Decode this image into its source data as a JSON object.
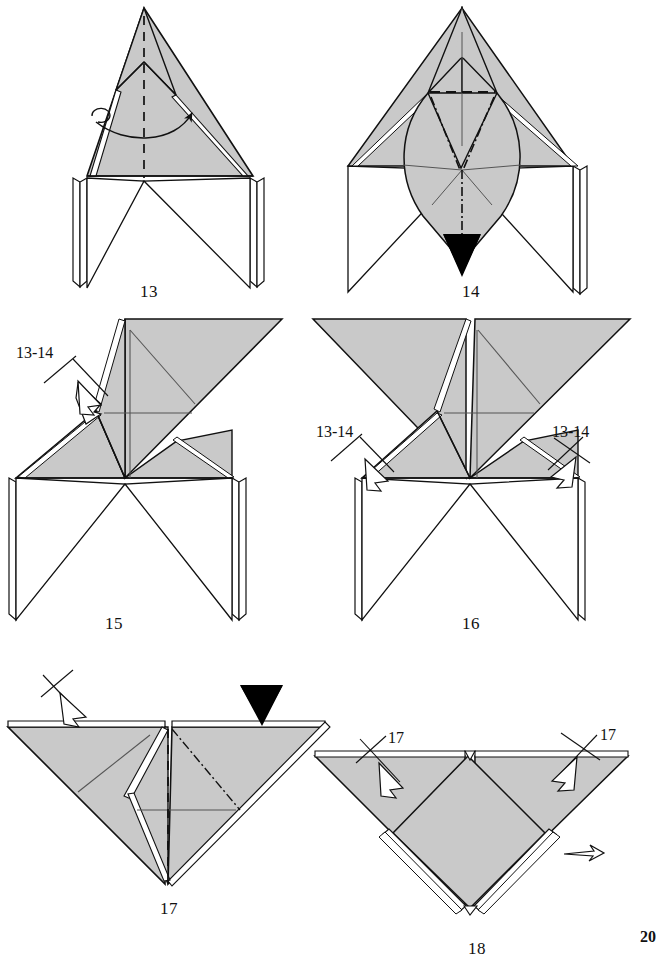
{
  "page": {
    "kind": "origami-instruction-diagram",
    "width": 653,
    "height": 968,
    "background_color": "#ffffff",
    "page_number": "20",
    "page_number_clipped": true
  },
  "style": {
    "paper_fill": "#c9c9c9",
    "paper_fill_light": "#d2d2d2",
    "paper_back": "#ffffff",
    "edge_stroke": "#111111",
    "crease_stroke": "#555555",
    "solid_arrow_fill": "#000000",
    "hollow_arrow_fill": "#ffffff"
  },
  "figures": [
    {
      "id": "fig-13",
      "step_number": "13",
      "label_x": 140,
      "label_y": 283,
      "symbols": [
        {
          "name": "fold-over-arrow",
          "kind": "curved-arrow",
          "meaning": "fold flap across to the right"
        },
        {
          "name": "valley-fold-line",
          "kind": "dashed-line",
          "meaning": "valley fold on vertical centre line"
        }
      ]
    },
    {
      "id": "fig-14",
      "step_number": "14",
      "label_x": 462,
      "label_y": 283,
      "symbols": [
        {
          "name": "push-in-arrow",
          "kind": "solid-black-arrow",
          "meaning": "push / sink here"
        },
        {
          "name": "valley-fold-line",
          "kind": "dashed-line",
          "meaning": "horizontal valley fold"
        },
        {
          "name": "mountain-fold-line",
          "kind": "dash-dot-line",
          "meaning": "mountain fold"
        }
      ]
    },
    {
      "id": "fig-15",
      "step_number": "15",
      "label_x": 105,
      "label_y": 615,
      "annotations": [
        {
          "name": "repeat-steps-callout-left",
          "text": "13-14",
          "x": 16,
          "y": 345
        }
      ],
      "symbols": [
        {
          "name": "repeat-arrow-with-cross",
          "kind": "hollow-arrow-crossed",
          "meaning": "repeat steps 13-14 here"
        }
      ]
    },
    {
      "id": "fig-16",
      "step_number": "16",
      "label_x": 462,
      "label_y": 615,
      "annotations": [
        {
          "name": "repeat-steps-callout-left",
          "text": "13-14",
          "x": 316,
          "y": 424
        },
        {
          "name": "repeat-steps-callout-right",
          "text": "13-14",
          "x": 552,
          "y": 424
        }
      ],
      "symbols": [
        {
          "name": "repeat-arrow-with-cross-left",
          "kind": "hollow-arrow-crossed",
          "meaning": "repeat steps 13-14 on left flap"
        },
        {
          "name": "repeat-arrow-with-cross-right",
          "kind": "hollow-arrow-crossed",
          "meaning": "repeat steps 13-14 on right flap"
        }
      ]
    },
    {
      "id": "fig-17",
      "step_number": "17",
      "label_x": 160,
      "label_y": 900,
      "symbols": [
        {
          "name": "push-in-arrow",
          "kind": "solid-black-arrow",
          "meaning": "push down here"
        },
        {
          "name": "repeat-arrow-with-cross",
          "kind": "hollow-arrow-crossed",
          "meaning": "repeat behind"
        },
        {
          "name": "valley-fold-line",
          "kind": "dashed-line",
          "meaning": "vertical valley fold"
        },
        {
          "name": "mountain-fold-line",
          "kind": "dash-dot-line",
          "meaning": "mountain fold"
        }
      ]
    },
    {
      "id": "fig-18",
      "step_number": "18",
      "label_x": 468,
      "label_y": 940,
      "annotations": [
        {
          "name": "repeat-step-callout-left",
          "text": "17",
          "x": 388,
          "y": 730
        },
        {
          "name": "repeat-step-callout-right",
          "text": "17",
          "x": 600,
          "y": 727
        }
      ],
      "symbols": [
        {
          "name": "repeat-arrow-with-cross-left",
          "kind": "hollow-arrow-crossed",
          "meaning": "repeat step 17 on left flap"
        },
        {
          "name": "repeat-arrow-with-cross-right",
          "kind": "hollow-arrow-crossed",
          "meaning": "repeat step 17 on right flap"
        },
        {
          "name": "turn-over-arrow",
          "kind": "hollow-arrow",
          "meaning": "turn model over / next"
        }
      ]
    }
  ]
}
